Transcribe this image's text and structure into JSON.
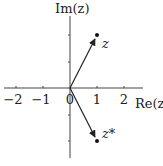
{
  "diagram": {
    "axes": {
      "x_label": "Re(z)",
      "y_label": "Im(z)",
      "x_ticks": [
        "−2",
        "−1",
        "0",
        "1",
        "2"
      ],
      "x_tick_values": [
        -2,
        -1,
        0,
        1,
        2
      ],
      "y_tick_values": [
        -2,
        -1,
        1,
        2
      ]
    },
    "points": [
      {
        "label": "z",
        "re": 1,
        "im": 2
      },
      {
        "label": "z*",
        "re": 1,
        "im": -2
      }
    ],
    "colors": {
      "axis": "#444444",
      "vector": "#222222",
      "background": "#ffffff"
    }
  }
}
